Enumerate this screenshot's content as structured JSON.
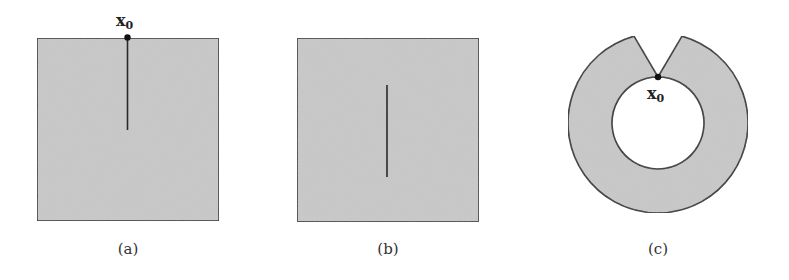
{
  "figure": {
    "panels": [
      {
        "id": "a",
        "label": "(a)",
        "shape": "square",
        "crack": "edge crack from top boundary point to interior",
        "point_label": {
          "base": "x",
          "sub": "0"
        }
      },
      {
        "id": "b",
        "label": "(b)",
        "shape": "square",
        "crack": "interior crack"
      },
      {
        "id": "c",
        "label": "(c)",
        "shape": "annulus with notch",
        "point_label": {
          "base": "x",
          "sub": "0"
        }
      }
    ],
    "colors": {
      "fill": "#c8c8c8",
      "stroke": "#2a2a2a",
      "background": "#ffffff"
    }
  }
}
